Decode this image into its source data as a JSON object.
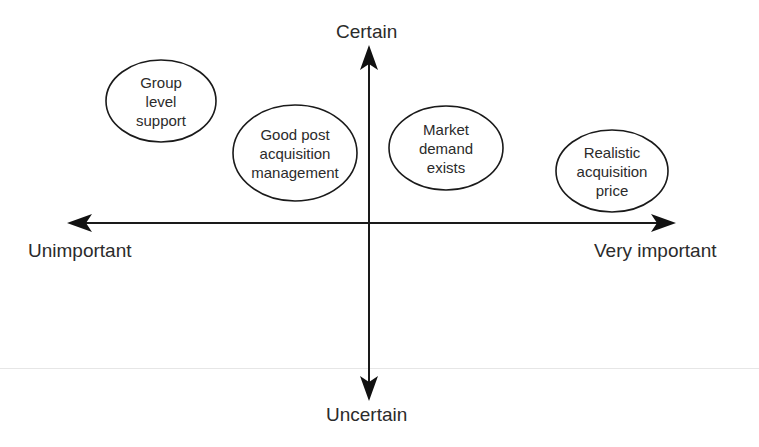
{
  "axes": {
    "vertical": {
      "top_label": "Certain",
      "bottom_label": "Uncertain"
    },
    "horizontal": {
      "left_label": "Unimportant",
      "right_label": "Very important"
    },
    "color": "#1a1a1a"
  },
  "nodes": [
    {
      "id": "group-level-support",
      "lines": [
        "Group",
        "level",
        "support"
      ],
      "cx": 161,
      "cy": 101,
      "rx": 55,
      "ry": 41
    },
    {
      "id": "good-post-acquisition-management",
      "lines": [
        "Good post",
        "acquisition",
        "management"
      ],
      "cx": 295,
      "cy": 153,
      "rx": 62,
      "ry": 48
    },
    {
      "id": "market-demand-exists",
      "lines": [
        "Market",
        "demand",
        "exists"
      ],
      "cx": 446,
      "cy": 148,
      "rx": 57,
      "ry": 42
    },
    {
      "id": "realistic-acquisition-price",
      "lines": [
        "Realistic",
        "acquisition",
        "price"
      ],
      "cx": 612,
      "cy": 171,
      "rx": 56,
      "ry": 41
    }
  ]
}
